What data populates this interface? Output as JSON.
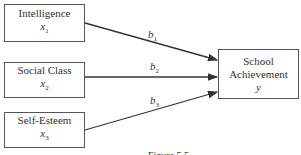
{
  "diagram": {
    "predictors": [
      {
        "label": "Intelligence",
        "var": "x",
        "sub": "1"
      },
      {
        "label": "Social Class",
        "var": "x",
        "sub": "2"
      },
      {
        "label": "Self-Esteem",
        "var": "x",
        "sub": "3"
      }
    ],
    "outcome": {
      "line1": "School",
      "line2": "Achievement",
      "var": "y"
    },
    "coefficients": [
      {
        "var": "b",
        "sub": "1"
      },
      {
        "var": "b",
        "sub": "2"
      },
      {
        "var": "b",
        "sub": "3"
      }
    ],
    "caption": "Figure 5.5"
  }
}
